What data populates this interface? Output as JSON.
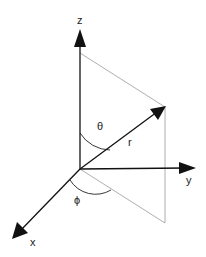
{
  "diagram": {
    "labels": {
      "z_axis": "z",
      "y_axis": "y",
      "x_axis": "x",
      "theta": "θ",
      "phi": "ϕ",
      "radius": "r"
    },
    "colors": {
      "axis": "#111111",
      "guide": "#9a9a9a",
      "text": "#222222",
      "background": "#ffffff"
    }
  }
}
